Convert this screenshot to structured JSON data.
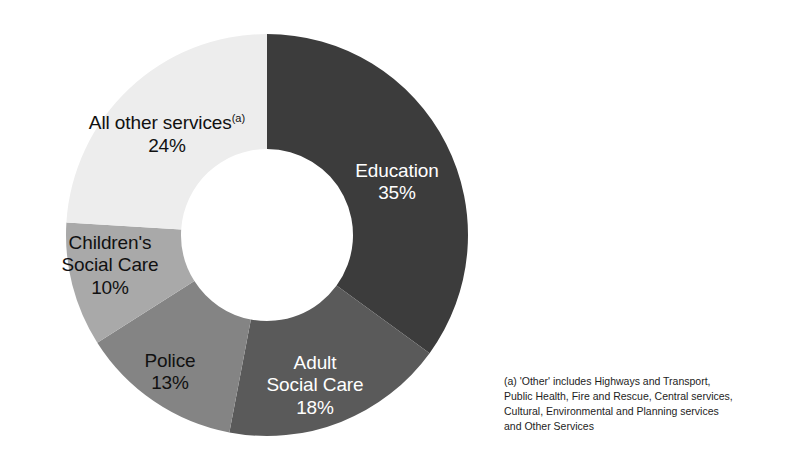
{
  "chart_data": {
    "type": "pie",
    "variant": "donut",
    "title": "",
    "subtitle": "",
    "xlabel": "",
    "ylabel": "",
    "legend_position": "none",
    "grid": false,
    "units": "percent",
    "total": 100,
    "start_angle_deg": 0,
    "direction": "clockwise",
    "categories": [
      "Education",
      "Adult Social Care",
      "Police",
      "Children's Social Care",
      "All other services"
    ],
    "values": [
      35,
      18,
      13,
      10,
      24
    ],
    "value_labels": [
      "35%",
      "18%",
      "13%",
      "10%",
      "24%"
    ],
    "colors": [
      "#3c3c3c",
      "#5a5a5a",
      "#848484",
      "#a9a9a9",
      "#ededed"
    ],
    "slices": [
      {
        "name": "Education",
        "label_lines": [
          "Education"
        ],
        "value": 35,
        "value_label": "35%",
        "color": "#3c3c3c",
        "text_color": "#ffffff",
        "start_deg": 0,
        "end_deg": 126
      },
      {
        "name": "Adult Social Care",
        "label_lines": [
          "Adult",
          "Social Care"
        ],
        "value": 18,
        "value_label": "18%",
        "color": "#5a5a5a",
        "text_color": "#ffffff",
        "start_deg": 126,
        "end_deg": 190.8
      },
      {
        "name": "Police",
        "label_lines": [
          "Police"
        ],
        "value": 13,
        "value_label": "13%",
        "color": "#848484",
        "text_color": "#111111",
        "start_deg": 190.8,
        "end_deg": 237.6
      },
      {
        "name": "Children's Social Care",
        "label_lines": [
          "Children's",
          "Social Care"
        ],
        "value": 10,
        "value_label": "10%",
        "color": "#a9a9a9",
        "text_color": "#111111",
        "start_deg": 237.6,
        "end_deg": 273.6
      },
      {
        "name": "All other services",
        "label_lines": [
          "All other services"
        ],
        "label_superscript": "(a)",
        "value": 24,
        "value_label": "24%",
        "color": "#ededed",
        "text_color": "#111111",
        "start_deg": 273.6,
        "end_deg": 360
      }
    ],
    "geometry": {
      "center_x": 267,
      "center_y": 235,
      "outer_radius": 201,
      "inner_radius": 86
    }
  },
  "labels": {
    "education": {
      "name": "Education",
      "value": "35%"
    },
    "adult_social_care": {
      "line1": "Adult",
      "line2": "Social Care",
      "value": "18%"
    },
    "police": {
      "name": "Police",
      "value": "13%"
    },
    "children_social_care": {
      "line1": "Children's",
      "line2": "Social Care",
      "value": "10%"
    },
    "all_other_services": {
      "name": "All other services",
      "superscript": "(a)",
      "value": "24%"
    }
  },
  "footnote": {
    "line1": "(a) 'Other' includes Highways and Transport,",
    "line2": "Public Health, Fire and Rescue, Central services,",
    "line3": "Cultural, Environmental and Planning services",
    "line4": "and Other Services"
  }
}
